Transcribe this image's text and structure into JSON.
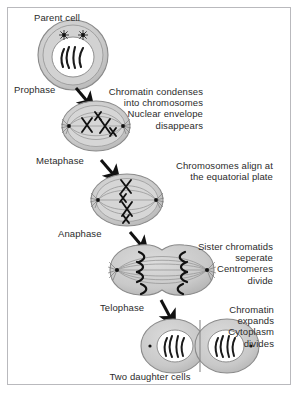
{
  "diagram": {
    "caption": "Two daughter cells",
    "colors": {
      "frame_border": "#b9b9bd",
      "background": "#ffffff",
      "cytoplasm": "#c9c9c9",
      "membrane_outline": "#8a8a8a",
      "nucleus": "#ffffff",
      "chromatin": "#1a1a1a",
      "spindle": "#8f8f8f",
      "arrow": "#111111",
      "text": "#2b2b2b"
    },
    "stages": [
      {
        "id": "parent-cell",
        "label": "Parent cell",
        "description": "",
        "cell_type": "round-cell-with-nucleus",
        "chromatin_strands": 4,
        "centrosomes": 2
      },
      {
        "id": "prophase",
        "label": "Prophase",
        "description": "Chromatin condenses\ninto chromosomes\nNuclear envelope\ndisappears",
        "cell_type": "oval-spindle-cell",
        "chromosomes": 4,
        "centrosomes": 2
      },
      {
        "id": "metaphase",
        "label": "Metaphase",
        "description": "Chromosomes align at\nthe equatorial plate",
        "cell_type": "oval-spindle-cell",
        "chromosomes": 4,
        "centrosomes": 2
      },
      {
        "id": "anaphase",
        "label": "Anaphase",
        "description": "Sister chromatids\nseperate\nCentromeres\ndivide",
        "cell_type": "elongated-spindle-cell",
        "chromatid_pairs": 4,
        "centrosomes": 2
      },
      {
        "id": "telophase",
        "label": "Telophase",
        "description": "Chromatin\nexpands\nCytoplasm\ndivides",
        "cell_type": "dividing-two-cells",
        "chromatin_strands": 4,
        "centrosomes": 2
      }
    ],
    "arrows": [
      {
        "id": "arrow-parent-to-prophase",
        "from": "parent-cell",
        "to": "prophase"
      },
      {
        "id": "arrow-prophase-to-metaphase",
        "from": "prophase",
        "to": "metaphase"
      },
      {
        "id": "arrow-metaphase-to-anaphase",
        "from": "metaphase",
        "to": "anaphase"
      },
      {
        "id": "arrow-anaphase-to-telophase",
        "from": "anaphase",
        "to": "telophase"
      }
    ]
  }
}
